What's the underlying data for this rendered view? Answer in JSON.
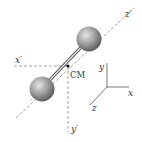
{
  "labels": {
    "z_prime": "z′",
    "x_prime": "x′",
    "y_prime": "y′",
    "cm": "CM",
    "y": "y",
    "x": "x",
    "z": "z"
  },
  "colors": {
    "sphere_light": "#d9d9d9",
    "sphere_dark": "#5e5e5e",
    "line": "#555555",
    "dashed": "#8a8a8a",
    "text": "#333333"
  }
}
